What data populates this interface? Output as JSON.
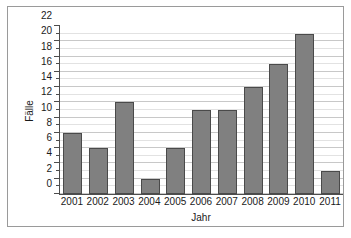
{
  "chart_data": {
    "type": "bar",
    "title": "",
    "xlabel": "Jahr",
    "ylabel": "Fälle",
    "categories": [
      "2001",
      "2002",
      "2003",
      "2004",
      "2005",
      "2006",
      "2007",
      "2008",
      "2009",
      "2010",
      "2011"
    ],
    "values": [
      8,
      6,
      12,
      2,
      6,
      11,
      11,
      14,
      17,
      21,
      3
    ],
    "ylim": [
      0,
      22
    ],
    "ytick_labels": [
      "0",
      "2",
      "4",
      "6",
      "8",
      "10",
      "12",
      "14",
      "16",
      "18",
      "20",
      "22"
    ],
    "ytick_values": [
      0,
      2,
      4,
      6,
      8,
      10,
      12,
      14,
      16,
      18,
      20,
      22
    ],
    "ytick_step": 2,
    "minor_gridline_step": 1,
    "grid": true,
    "grid_axis": "y",
    "legend": false,
    "legend_position": "none",
    "colors": {
      "bar_fill": "#808080",
      "bar_border": "#4a4a4a",
      "gridline_minor": "#e2e2e2",
      "gridline_major": "#c8c8c8",
      "axis": "#4d4d4d",
      "frame": "#9a9a9a",
      "text": "#1a1a1a",
      "background": "#ffffff"
    }
  }
}
